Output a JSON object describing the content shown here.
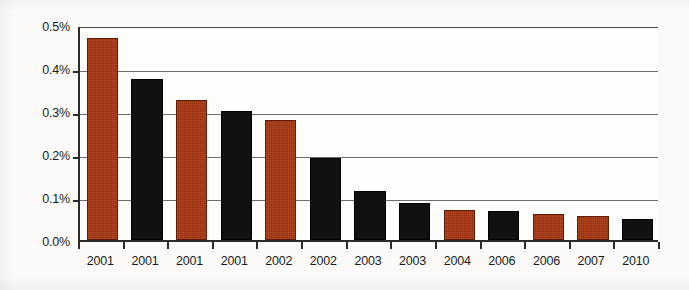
{
  "chart_data": {
    "type": "bar",
    "title": "",
    "subtitle": "",
    "xlabel": "",
    "ylabel": "",
    "categories": [
      "2001",
      "2001",
      "2001",
      "2001",
      "2002",
      "2002",
      "2003",
      "2003",
      "2004",
      "2006",
      "2006",
      "2007",
      "2010"
    ],
    "values": [
      0.47,
      0.375,
      0.325,
      0.3,
      0.28,
      0.19,
      0.115,
      0.085,
      0.07,
      0.068,
      0.06,
      0.055,
      0.05
    ],
    "value_unit": "%",
    "bar_colors": [
      "red",
      "black",
      "red",
      "black",
      "red",
      "black",
      "black",
      "black",
      "red",
      "black",
      "red",
      "red",
      "black"
    ],
    "ylim": [
      0.0,
      0.5
    ],
    "ytick_values": [
      0.5,
      0.4,
      0.3,
      0.2,
      0.1,
      0.0
    ],
    "ytick_labels": [
      "0.5%",
      "0.4%",
      "0.3%",
      "0.2%",
      "0.1%",
      "0.0%"
    ],
    "grid": true,
    "grid_axis": "y",
    "legend": false,
    "legend_position": "none",
    "series": [
      {
        "name": "",
        "values": [
          0.47,
          0.375,
          0.325,
          0.3,
          0.28,
          0.19,
          0.115,
          0.085,
          0.07,
          0.068,
          0.06,
          0.055,
          0.05
        ]
      }
    ],
    "colors": {
      "red": "#a8330f",
      "black": "#111111",
      "axis": "#2b2b2b",
      "gridline": "#6e6e6e",
      "background": "#fbfaf8",
      "text": "#1a1a1a"
    }
  }
}
